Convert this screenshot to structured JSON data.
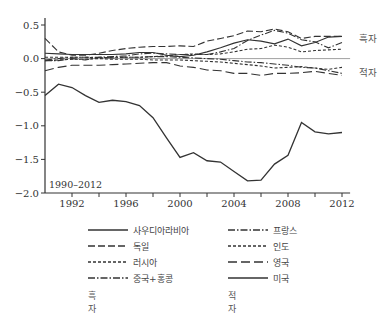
{
  "chart_data": {
    "type": "line",
    "title": "",
    "period_label": "1990–2012",
    "xlabel": "",
    "ylabel": "",
    "xlim": [
      1990,
      2012.5
    ],
    "ylim": [
      -2.0,
      0.55
    ],
    "xticks": [
      1992,
      1996,
      2000,
      2004,
      2008,
      2012
    ],
    "yticks": [
      "0.5",
      "0.0",
      "−0.5",
      "−1.0",
      "−1.5",
      "−2.0"
    ],
    "ytick_values": [
      0.5,
      0.0,
      -0.5,
      -1.0,
      -1.5,
      -2.0
    ],
    "annotations": [
      {
        "text": "흑자",
        "x": 2012.5,
        "y": 0.3
      },
      {
        "text": "적자",
        "x": 2012.5,
        "y": -0.2
      }
    ],
    "x": [
      1990,
      1991,
      1992,
      1993,
      1994,
      1995,
      1996,
      1997,
      1998,
      1999,
      2000,
      2001,
      2002,
      2003,
      2004,
      2005,
      2006,
      2007,
      2008,
      2009,
      2010,
      2011,
      2012
    ],
    "series": [
      {
        "name": "사우디아라비아",
        "group": "흑자",
        "style": "solid",
        "values": [
          -0.55,
          -0.38,
          -0.43,
          -0.55,
          -0.65,
          -0.62,
          -0.64,
          -0.7,
          -0.88,
          -1.18,
          -1.47,
          -1.4,
          -1.52,
          -1.54,
          -1.68,
          -1.82,
          -1.81,
          -1.57,
          -1.44,
          -0.95,
          -1.09,
          -1.12,
          -1.1
        ]
      },
      {
        "name": "독일",
        "group": "흑자",
        "style": "dashed",
        "values": [
          0.3,
          0.1,
          0.05,
          0.05,
          0.08,
          0.12,
          0.15,
          0.17,
          0.18,
          0.18,
          0.19,
          0.18,
          0.26,
          0.3,
          0.34,
          0.41,
          0.4,
          0.44,
          0.4,
          0.3,
          0.33,
          0.33,
          0.33
        ]
      },
      {
        "name": "러시아",
        "group": "흑자",
        "style": "dotted",
        "values": [
          0.02,
          0.02,
          0.02,
          0.02,
          0.01,
          0.02,
          0.02,
          0.02,
          0.03,
          0.04,
          0.06,
          0.07,
          0.06,
          0.07,
          0.1,
          0.14,
          0.15,
          0.2,
          0.17,
          0.1,
          0.12,
          0.13,
          0.14
        ]
      },
      {
        "name": "중국+홍콩",
        "group": "흑자",
        "style": "dashdot",
        "values": [
          -0.03,
          -0.03,
          0.0,
          -0.02,
          0.02,
          0.03,
          0.04,
          0.07,
          0.08,
          0.07,
          0.06,
          0.06,
          0.06,
          0.1,
          0.15,
          0.27,
          0.35,
          0.42,
          0.38,
          0.28,
          0.25,
          0.16,
          0.24
        ]
      },
      {
        "name": "프랑스",
        "group": "적자",
        "style": "dashdot",
        "values": [
          -0.02,
          0.0,
          0.02,
          0.02,
          0.02,
          0.01,
          0.02,
          0.02,
          0.03,
          0.03,
          0.02,
          0.01,
          0.0,
          -0.01,
          -0.03,
          -0.05,
          -0.06,
          -0.08,
          -0.1,
          -0.13,
          -0.14,
          -0.18,
          -0.22
        ]
      },
      {
        "name": "인도",
        "group": "적자",
        "style": "dotted",
        "values": [
          -0.03,
          -0.02,
          -0.01,
          -0.01,
          0.0,
          -0.01,
          -0.01,
          -0.01,
          -0.02,
          -0.02,
          -0.02,
          -0.03,
          -0.04,
          -0.05,
          -0.07,
          -0.09,
          -0.11,
          -0.14,
          -0.13,
          -0.12,
          -0.14,
          -0.16,
          -0.13
        ]
      },
      {
        "name": "영국",
        "group": "적자",
        "style": "longdash",
        "values": [
          -0.18,
          -0.13,
          -0.1,
          -0.1,
          -0.1,
          -0.09,
          -0.08,
          -0.07,
          -0.06,
          -0.06,
          -0.11,
          -0.13,
          -0.17,
          -0.18,
          -0.22,
          -0.22,
          -0.25,
          -0.22,
          -0.22,
          -0.21,
          -0.19,
          -0.22,
          -0.25
        ]
      },
      {
        "name": "미국",
        "group": "적자",
        "style": "solid",
        "values": [
          0.08,
          0.07,
          0.06,
          0.06,
          0.06,
          0.06,
          0.07,
          0.09,
          0.09,
          0.05,
          0.03,
          0.05,
          0.1,
          0.16,
          0.23,
          0.28,
          0.26,
          0.22,
          0.29,
          0.19,
          0.24,
          0.32,
          0.33
        ]
      }
    ],
    "legend": {
      "position": "bottom",
      "columns": [
        {
          "items": [
            "사우디아라비아",
            "독일",
            "러시아",
            "중국+홍콩"
          ],
          "footer": "흑자"
        },
        {
          "items": [
            "프랑스",
            "인도",
            "영국",
            "미국"
          ],
          "footer": "적자"
        }
      ]
    },
    "grid": false
  }
}
